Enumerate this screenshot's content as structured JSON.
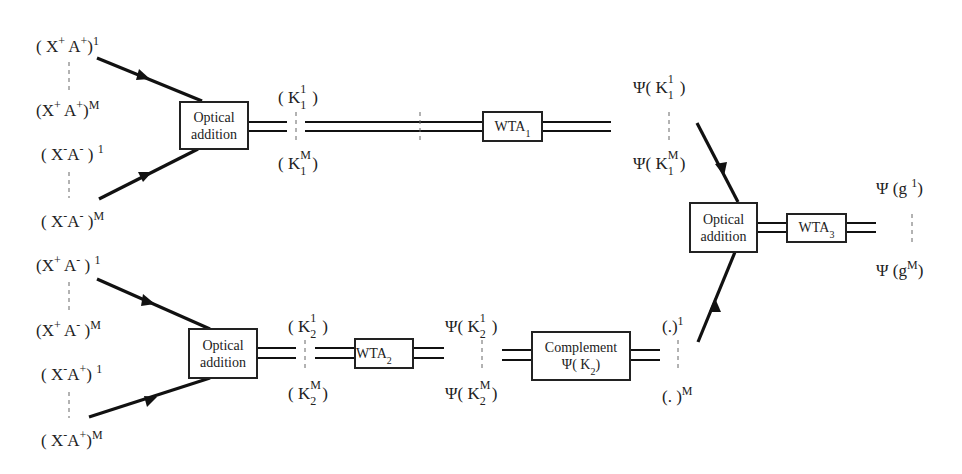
{
  "inputs_top": [
    {
      "x": "X",
      "xs": "+",
      "a": "A",
      "as": "+",
      "idx": "1"
    },
    {
      "x": "X",
      "xs": "+",
      "a": "A",
      "as": "+",
      "idx": "M"
    },
    {
      "x": "X",
      "xs": "-",
      "a": "A",
      "as": "-",
      "idx": "1"
    },
    {
      "x": "X",
      "xs": "-",
      "a": "A",
      "as": "-",
      "idx": "M"
    }
  ],
  "inputs_bottom": [
    {
      "x": "X",
      "xs": "+",
      "a": "A",
      "as": "-",
      "idx": "1"
    },
    {
      "x": "X",
      "xs": "+",
      "a": "A",
      "as": "-",
      "idx": "M"
    },
    {
      "x": "X",
      "xs": "-",
      "a": "A",
      "as": "+",
      "idx": "1"
    },
    {
      "x": "X",
      "xs": "-",
      "a": "A",
      "as": "+",
      "idx": "M"
    }
  ],
  "boxes": {
    "optical_top": {
      "line1": "Optical",
      "line2": "addition"
    },
    "optical_bottom": {
      "line1": "Optical",
      "line2": "addition"
    },
    "optical_right": {
      "line1": "Optical",
      "line2": "addition"
    },
    "wta1": {
      "label": "WTA",
      "sub": "1"
    },
    "wta2": {
      "label": "WTA",
      "sub": "2"
    },
    "wta3": {
      "label": "WTA",
      "sub": "3"
    },
    "complement": {
      "line1": "Complement",
      "psi": "Ψ",
      "k": "K",
      "sub": "2"
    }
  },
  "signals": {
    "k1_first": {
      "prefix": "",
      "var": "K",
      "sup": "1",
      "sub": "1"
    },
    "k1_last": {
      "prefix": "",
      "var": "K",
      "sup": "M",
      "sub": "1"
    },
    "psi_k1_first": {
      "prefix": "Ψ",
      "var": "K",
      "sup": "1",
      "sub": "1"
    },
    "psi_k1_last": {
      "prefix": "Ψ",
      "var": "K",
      "sup": "M",
      "sub": "1"
    },
    "k2_first": {
      "prefix": "",
      "var": "K",
      "sup": "1",
      "sub": "2"
    },
    "k2_last": {
      "prefix": "",
      "var": "K",
      "sup": "M",
      "sub": "2"
    },
    "psi_k2_first": {
      "prefix": "Ψ",
      "var": "K",
      "sup": "1",
      "sub": "2"
    },
    "psi_k2_last": {
      "prefix": "Ψ",
      "var": "K",
      "sup": "M",
      "sub": "2"
    },
    "dot_first": {
      "text": "(.)",
      "sup": "1"
    },
    "dot_last": {
      "text": "(. )",
      "sup": "M"
    },
    "psi_g_first": {
      "prefix": "Ψ",
      "var": "g",
      "sup": "1"
    },
    "psi_g_last": {
      "prefix": "Ψ",
      "var": "g",
      "sup": "M"
    }
  },
  "paren_open": "(",
  "paren_close": ")"
}
